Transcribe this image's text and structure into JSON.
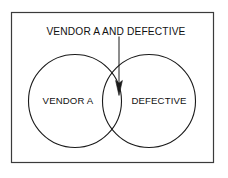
{
  "figure": {
    "kind": "venn-diagram",
    "title": "VENDOR A AND DEFECTIVE",
    "background_color": "#ffffff",
    "border_color": "#3b3b3b",
    "stroke_color": "#1a1a1a",
    "text_color": "#111111"
  },
  "sets": {
    "left": {
      "label": "VENDOR A",
      "fill": "none"
    },
    "right": {
      "label": "DEFECTIVE",
      "fill": "none"
    },
    "intersection": {
      "label": "VENDOR A AND DEFECTIVE",
      "fill": "none"
    }
  },
  "annotation": {
    "callout_label": "VENDOR A AND DEFECTIVE",
    "pointer": "down-arrow"
  },
  "icons": {
    "arrow": "arrow-down-icon"
  }
}
